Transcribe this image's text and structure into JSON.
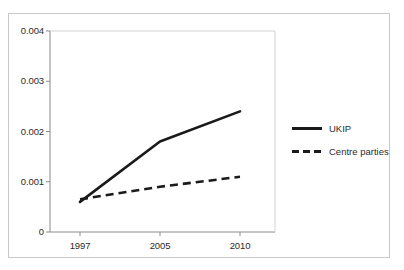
{
  "chart_data": {
    "type": "line",
    "title": "",
    "xlabel": "",
    "ylabel": "",
    "categories": [
      "1997",
      "2005",
      "2010"
    ],
    "x_tick_labels": [
      "1997",
      "2005",
      "2010"
    ],
    "y_tick_labels": [
      "0",
      "0.001",
      "0.002",
      "0.003",
      "0.004"
    ],
    "y_tick_values": [
      0,
      0.001,
      0.002,
      0.003,
      0.004
    ],
    "ylim": [
      0,
      0.004
    ],
    "grid": false,
    "legend_position": "right",
    "series": [
      {
        "name": "UKIP",
        "style": "solid",
        "color": "#1a1a1a",
        "values": [
          0.0006,
          0.0018,
          0.0024
        ]
      },
      {
        "name": "Centre parties",
        "style": "dashed",
        "color": "#1a1a1a",
        "values": [
          0.00065,
          0.0009,
          0.0011
        ]
      }
    ]
  },
  "legend": {
    "items": [
      {
        "label": "UKIP",
        "style": "solid"
      },
      {
        "label": "Centre parties",
        "style": "dashed"
      }
    ]
  },
  "axes": {
    "y_labels": [
      "0.004",
      "0.003",
      "0.002",
      "0.001",
      "0"
    ],
    "x_labels": [
      "1997",
      "2005",
      "2010"
    ]
  },
  "colors": {
    "series_line": "#1a1a1a",
    "axis": "#808080",
    "frame": "#c9c9c9",
    "text": "#2b2b2b",
    "background": "#ffffff"
  }
}
